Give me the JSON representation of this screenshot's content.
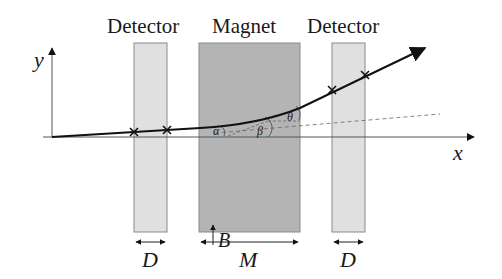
{
  "diagram": {
    "title_labels": {
      "detector_left": "Detector",
      "magnet": "Magnet",
      "detector_right": "Detector"
    },
    "axes": {
      "x_label": "x",
      "y_label": "y"
    },
    "regions": [
      {
        "name": "detector-left",
        "x": 134,
        "width": 33,
        "fill": "#e0e0e0"
      },
      {
        "name": "magnet",
        "x": 199,
        "width": 101,
        "fill": "#b4b4b4"
      },
      {
        "name": "detector-right",
        "x": 332,
        "width": 33,
        "fill": "#e0e0e0"
      }
    ],
    "field_label": "B",
    "dimension_labels": {
      "detector_left_width": "D",
      "magnet_width": "M",
      "detector_right_width": "D"
    },
    "angle_labels": {
      "alpha": "α",
      "beta": "β",
      "theta": "θ"
    },
    "hit_markers": [
      {
        "x": 134,
        "y": 132
      },
      {
        "x": 167,
        "y": 130
      },
      {
        "x": 332,
        "y": 90
      },
      {
        "x": 365,
        "y": 75
      }
    ]
  }
}
